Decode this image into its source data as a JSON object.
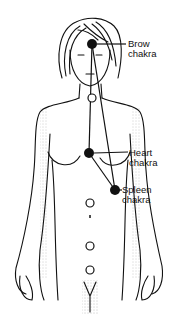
{
  "figure": {
    "labels": [
      {
        "id": "brow",
        "line1": "Brow",
        "line2": "chakra"
      },
      {
        "id": "heart",
        "line1": "Heart",
        "line2": "chakra"
      },
      {
        "id": "spleen",
        "line1": "Spleen",
        "line2": "chakra"
      }
    ],
    "colors": {
      "ink": "#111111",
      "background": "#ffffff"
    }
  }
}
